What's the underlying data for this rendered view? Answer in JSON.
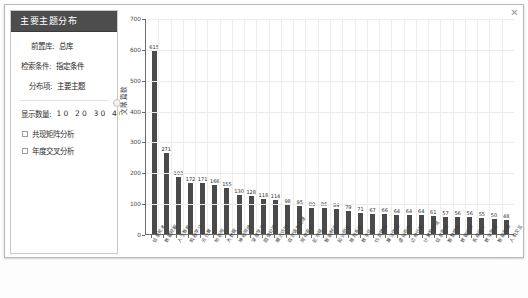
{
  "window": {
    "close_label": "✕"
  },
  "panel": {
    "title": "主要主题分布",
    "fields": [
      {
        "label": "前置库:",
        "value": "总库"
      },
      {
        "label": "检索条件:",
        "value": "指定条件"
      },
      {
        "label": "分布项:",
        "value": "主要主题"
      }
    ],
    "count_label": "显示数量:",
    "count_options": "10 20 30 40",
    "checkboxes": [
      {
        "label": "共现矩阵分析",
        "checked": false
      },
      {
        "label": "年度交叉分析",
        "checked": false
      }
    ]
  },
  "chart_data": {
    "type": "bar",
    "title": "",
    "xlabel": "",
    "ylabel": "文献篇数",
    "ylim": [
      0,
      700
    ],
    "yticks": [
      0,
      100,
      200,
      300,
      400,
      500,
      600,
      700
    ],
    "grid": true,
    "legend": null,
    "bar_color": "#4a4a4a",
    "categories": [
      "信息技术",
      "数据挖掘",
      "人工智能",
      "机器学习",
      "云计算",
      "物联网",
      "大数据",
      "神经网络",
      "深度学习",
      "图像处理",
      "模式识别",
      "自然语言处理",
      "网络安全",
      "区块链",
      "智能制造",
      "知识图谱",
      "推荐系统",
      "数字化",
      "仿真建模",
      "算法优化",
      "虚拟现实",
      "边缘计算",
      "计算机视觉",
      "信息安全",
      "智慧城市",
      "数据分析",
      "系统设计",
      "数字孪生",
      "智能交通",
      "人机交互"
    ],
    "values": [
      615,
      271,
      193,
      172,
      171,
      166,
      155,
      130,
      128,
      118,
      114,
      98,
      95,
      89,
      86,
      84,
      79,
      71,
      67,
      66,
      64,
      64,
      64,
      61,
      57,
      56,
      56,
      55,
      50,
      48
    ]
  }
}
